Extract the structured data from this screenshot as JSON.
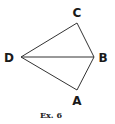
{
  "figure": {
    "caption": "Ex. 6",
    "vertices": [
      {
        "name": "A",
        "x": 77,
        "y": 90,
        "label_x": 77,
        "label_y": 105
      },
      {
        "name": "B",
        "x": 94,
        "y": 57,
        "label_x": 103,
        "label_y": 62
      },
      {
        "name": "C",
        "x": 77,
        "y": 23,
        "label_x": 77,
        "label_y": 17
      },
      {
        "name": "D",
        "x": 21,
        "y": 57,
        "label_x": 9,
        "label_y": 62
      }
    ],
    "edges": [
      [
        "D",
        "C"
      ],
      [
        "C",
        "B"
      ],
      [
        "B",
        "A"
      ],
      [
        "A",
        "D"
      ],
      [
        "D",
        "B"
      ]
    ]
  }
}
